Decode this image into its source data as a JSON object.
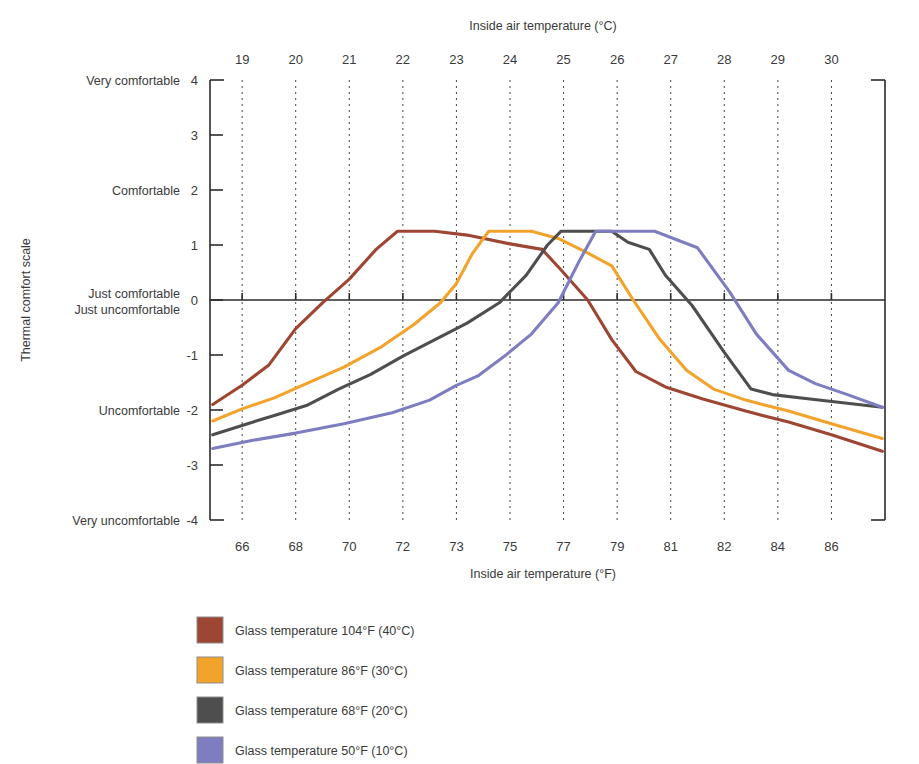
{
  "chart_data": {
    "type": "line",
    "title": "",
    "xlabel_top": "Inside air temperature (°C)",
    "xlabel_bottom": "Inside air temperature (°F)",
    "ylabel": "Thermal comfort scale",
    "x_top_ticks": [
      19,
      20,
      21,
      22,
      23,
      24,
      25,
      26,
      27,
      28,
      29,
      30
    ],
    "x_bottom_ticks": [
      66,
      68,
      70,
      72,
      73,
      75,
      77,
      79,
      81,
      82,
      84,
      86
    ],
    "xlim": [
      18.4,
      31.0
    ],
    "ylim": [
      -4,
      4
    ],
    "y_ticks": [
      4,
      3,
      2,
      1,
      0,
      -1,
      -2,
      -3,
      -4
    ],
    "y_tick_words": {
      "4": "Very comfortable",
      "2": "Comfortable",
      "0": "Just comfortable",
      "0b": "Just uncomfortable",
      "-2": "Uncomfortable",
      "-4": "Very uncomfortable"
    },
    "grid": "vertical-dotted",
    "legend_position": "below-left",
    "series": [
      {
        "name": "Glass temperature 104°F (40°C)",
        "color": "#9e4634",
        "points": [
          [
            18.45,
            -1.9
          ],
          [
            19.0,
            -1.55
          ],
          [
            19.5,
            -1.18
          ],
          [
            20.0,
            -0.52
          ],
          [
            20.5,
            -0.05
          ],
          [
            21.0,
            0.38
          ],
          [
            21.5,
            0.92
          ],
          [
            21.9,
            1.25
          ],
          [
            22.6,
            1.25
          ],
          [
            23.2,
            1.18
          ],
          [
            24.0,
            1.02
          ],
          [
            24.6,
            0.92
          ],
          [
            24.95,
            0.55
          ],
          [
            25.45,
            0.0
          ],
          [
            25.9,
            -0.72
          ],
          [
            26.35,
            -1.3
          ],
          [
            26.9,
            -1.58
          ],
          [
            27.6,
            -1.8
          ],
          [
            28.4,
            -2.02
          ],
          [
            29.2,
            -2.22
          ],
          [
            30.0,
            -2.45
          ],
          [
            30.95,
            -2.75
          ]
        ]
      },
      {
        "name": "Glass temperature 86°F (30°C)",
        "color": "#f2a32c",
        "points": [
          [
            18.45,
            -2.2
          ],
          [
            19.0,
            -1.98
          ],
          [
            19.6,
            -1.78
          ],
          [
            20.2,
            -1.52
          ],
          [
            20.9,
            -1.22
          ],
          [
            21.6,
            -0.85
          ],
          [
            22.2,
            -0.45
          ],
          [
            22.7,
            -0.05
          ],
          [
            23.0,
            0.3
          ],
          [
            23.3,
            0.85
          ],
          [
            23.6,
            1.25
          ],
          [
            24.4,
            1.25
          ],
          [
            24.9,
            1.12
          ],
          [
            25.4,
            0.88
          ],
          [
            25.9,
            0.62
          ],
          [
            26.3,
            0.0
          ],
          [
            26.8,
            -0.72
          ],
          [
            27.3,
            -1.28
          ],
          [
            27.8,
            -1.62
          ],
          [
            28.4,
            -1.82
          ],
          [
            29.2,
            -2.02
          ],
          [
            30.0,
            -2.25
          ],
          [
            30.95,
            -2.52
          ]
        ]
      },
      {
        "name": "Glass temperature 68°F (20°C)",
        "color": "#4e4e4e",
        "points": [
          [
            18.45,
            -2.45
          ],
          [
            19.0,
            -2.28
          ],
          [
            19.6,
            -2.1
          ],
          [
            20.2,
            -1.92
          ],
          [
            20.8,
            -1.62
          ],
          [
            21.4,
            -1.35
          ],
          [
            22.0,
            -1.02
          ],
          [
            22.6,
            -0.72
          ],
          [
            23.2,
            -0.42
          ],
          [
            23.8,
            -0.05
          ],
          [
            24.3,
            0.45
          ],
          [
            24.7,
            1.0
          ],
          [
            24.95,
            1.25
          ],
          [
            25.9,
            1.25
          ],
          [
            26.2,
            1.05
          ],
          [
            26.6,
            0.92
          ],
          [
            26.9,
            0.45
          ],
          [
            27.4,
            -0.1
          ],
          [
            28.0,
            -0.95
          ],
          [
            28.5,
            -1.62
          ],
          [
            28.9,
            -1.72
          ],
          [
            29.6,
            -1.8
          ],
          [
            30.95,
            -1.95
          ]
        ]
      },
      {
        "name": "Glass temperature 50°F (10°C)",
        "color": "#7d7dc0",
        "points": [
          [
            18.45,
            -2.7
          ],
          [
            19.2,
            -2.55
          ],
          [
            20.0,
            -2.42
          ],
          [
            20.9,
            -2.25
          ],
          [
            21.8,
            -2.05
          ],
          [
            22.5,
            -1.82
          ],
          [
            23.0,
            -1.55
          ],
          [
            23.4,
            -1.38
          ],
          [
            23.9,
            -1.02
          ],
          [
            24.4,
            -0.62
          ],
          [
            24.9,
            -0.05
          ],
          [
            25.3,
            0.72
          ],
          [
            25.6,
            1.25
          ],
          [
            26.7,
            1.25
          ],
          [
            27.1,
            1.1
          ],
          [
            27.5,
            0.95
          ],
          [
            28.1,
            0.15
          ],
          [
            28.6,
            -0.62
          ],
          [
            29.2,
            -1.28
          ],
          [
            29.7,
            -1.52
          ],
          [
            30.3,
            -1.72
          ],
          [
            30.95,
            -1.95
          ]
        ]
      }
    ]
  },
  "legend": {
    "items": [
      {
        "label": "Glass temperature 104°F (40°C)",
        "color": "#9e4634"
      },
      {
        "label": "Glass temperature 86°F (30°C)",
        "color": "#f2a32c"
      },
      {
        "label": "Glass temperature 68°F (20°C)",
        "color": "#4e4e4e"
      },
      {
        "label": "Glass temperature 50°F (10°C)",
        "color": "#7d7dc0"
      }
    ]
  }
}
